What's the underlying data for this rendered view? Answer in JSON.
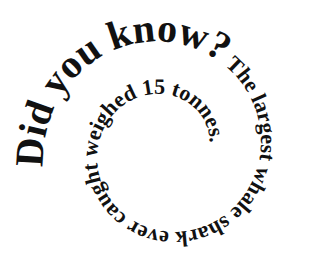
{
  "graphic": {
    "background": "#ffffff",
    "text_color": "#111111",
    "headline": "Did you know?",
    "body": " The largest whale shark ever caught weighed 15 tonnes.",
    "full_text": "Did you know? The largest whale shark ever caught weighed 15 tonnes.",
    "layout": "clockwise spiral, shrinking inward"
  }
}
